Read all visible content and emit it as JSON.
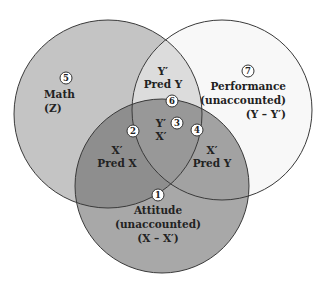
{
  "diagram": {
    "type": "venn",
    "colors": {
      "math": "#c4c4c4",
      "performance": "#f8f8f8",
      "attitude": "#a8a8a8",
      "math_performance": "#dcdcdc",
      "math_attitude": "#8e8e8e",
      "performance_attitude": "#a2a2a2",
      "all_three": "#989898",
      "stroke": "#3a3a3a"
    },
    "circles": [
      {
        "id": "math",
        "label": "Math",
        "symbol": "(Z)"
      },
      {
        "id": "performance",
        "label": "Performance",
        "sub": "(unaccounted)",
        "symbol": "(Y – Y′)"
      },
      {
        "id": "attitude",
        "label": "Attitude",
        "sub": "(unaccounted)",
        "symbol": "(X – X′)"
      }
    ],
    "regions": [
      {
        "num": "1",
        "lines": [
          "Attitude",
          "(unaccounted)",
          "(X – X′)"
        ]
      },
      {
        "num": "2",
        "lines": [
          "X′",
          "Pred X"
        ]
      },
      {
        "num": "3",
        "lines": [
          "Y′",
          "X′"
        ]
      },
      {
        "num": "4",
        "lines": [
          "X′",
          "Pred Y"
        ]
      },
      {
        "num": "5",
        "lines": [
          "Math",
          "(Z)"
        ]
      },
      {
        "num": "6",
        "lines": [
          "Y′",
          "Pred Y"
        ]
      },
      {
        "num": "7",
        "lines": [
          "Performance",
          "(unaccounted)",
          "(Y – Y′)"
        ]
      }
    ]
  }
}
